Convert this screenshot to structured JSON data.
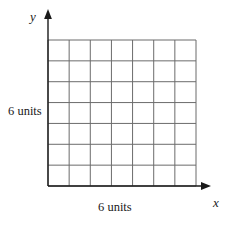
{
  "figure": {
    "name": "coordinate-grid-diagram",
    "background_color": "#ffffff",
    "axes": {
      "line_color": "#1a1a1a",
      "x_axis": {
        "label": "x",
        "arrow": "arrow-right-icon",
        "start_x": 48,
        "end_x": 212,
        "y": 186
      },
      "y_axis": {
        "label": "y",
        "arrow": "arrow-up-icon",
        "x": 48,
        "start_y": 186,
        "end_y": 14
      }
    },
    "grid": {
      "columns": 7,
      "rows": 7,
      "left": 48,
      "top": 40,
      "right": 196,
      "bottom": 186,
      "cell_width": 21.14,
      "cell_height": 20.86,
      "line_color": "#6b6b6b",
      "line_width": 1,
      "fill": "#ffffff"
    },
    "labels": {
      "vertical_units": "6 units",
      "horizontal_units": "6 units"
    }
  },
  "chart_data": {
    "type": "diagram",
    "title": "",
    "xlabel": "x",
    "ylabel": "y",
    "grid": true,
    "grid_columns": 7,
    "grid_rows": 7,
    "annotations": [
      {
        "text": "6 units",
        "position": "left-of-grid",
        "describes": "vertical side length"
      },
      {
        "text": "6 units",
        "position": "below-grid",
        "describes": "horizontal side length"
      }
    ]
  }
}
